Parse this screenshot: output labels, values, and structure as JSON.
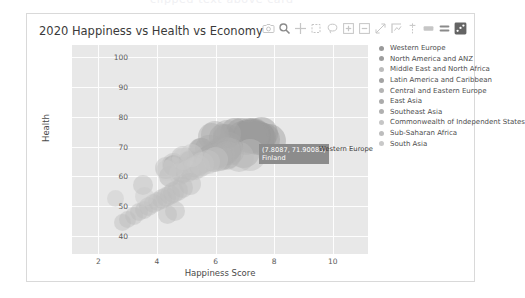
{
  "ghost_text": "clipped text above card",
  "chart_title": "2020 Happiness vs Health vs Economy",
  "modebar": {
    "buttons": [
      {
        "name": "camera-icon",
        "label": "Download plot as a png"
      },
      {
        "name": "zoom-icon",
        "label": "Zoom"
      },
      {
        "name": "pan-icon",
        "label": "Pan"
      },
      {
        "name": "zoom-box-select-icon",
        "label": "Box Select"
      },
      {
        "name": "lasso-select-icon",
        "label": "Lasso Select"
      },
      {
        "name": "zoom-in-icon",
        "label": "Zoom in"
      },
      {
        "name": "zoom-out-icon",
        "label": "Zoom out"
      },
      {
        "name": "autoscale-icon",
        "label": "Autoscale"
      },
      {
        "name": "reset-axes-icon",
        "label": "Reset axes"
      },
      {
        "name": "spike-lines-icon",
        "label": "Toggle Spike Lines"
      },
      {
        "name": "hover-compare-icon",
        "label": "Show closest data on hover"
      },
      {
        "name": "hover-closest-icon",
        "label": "Compare data on hover"
      },
      {
        "name": "plotly-logo-icon",
        "label": "Produced with Plotly"
      }
    ]
  },
  "tooltip": {
    "coords": "(7.8087, 71.90083)",
    "country": "Finland",
    "trace": "Western Europe"
  },
  "legend": {
    "items": [
      {
        "label": "Western Europe",
        "color": "#9a9a9a"
      },
      {
        "label": "North America and ANZ",
        "color": "#9e9e9e"
      },
      {
        "label": "Middle East and North Africa",
        "color": "#bcbcbc"
      },
      {
        "label": "Latin America and Caribbean",
        "color": "#a3a3a3"
      },
      {
        "label": "Central and Eastern Europe",
        "color": "#b4b4b4"
      },
      {
        "label": "East Asia",
        "color": "#ababab"
      },
      {
        "label": "Southeast Asia",
        "color": "#b0b0b0"
      },
      {
        "label": "Commonwealth of Independent States",
        "color": "#c6c6c6"
      },
      {
        "label": "Sub-Saharan Africa",
        "color": "#bdbdbd"
      },
      {
        "label": "South Asia",
        "color": "#c9c9c9"
      }
    ]
  },
  "chart_data": {
    "type": "scatter",
    "title": "2020 Happiness vs Health vs Economy",
    "xlabel": "Happiness Score",
    "ylabel": "Health",
    "xlim": [
      1.1,
      11.2
    ],
    "ylim": [
      34,
      104
    ],
    "xticks": [
      2,
      4,
      6,
      8,
      10
    ],
    "yticks": [
      40,
      50,
      60,
      70,
      80,
      90,
      100
    ],
    "grid": true,
    "legend_position": "right",
    "size_encodes": "Economy (GDP per capita)",
    "marker_opacity": 0.45,
    "series": [
      {
        "name": "Western Europe",
        "color": "#9a9a9a",
        "points": [
          {
            "x": 7.81,
            "y": 71.9,
            "size": 34,
            "label": "Finland"
          },
          {
            "x": 7.65,
            "y": 72.4,
            "size": 33
          },
          {
            "x": 7.56,
            "y": 74.4,
            "size": 33
          },
          {
            "x": 7.5,
            "y": 73.0,
            "size": 32
          },
          {
            "x": 7.45,
            "y": 72.7,
            "size": 34
          },
          {
            "x": 7.35,
            "y": 73.3,
            "size": 31
          },
          {
            "x": 7.3,
            "y": 73.9,
            "size": 32
          },
          {
            "x": 7.23,
            "y": 72.6,
            "size": 31
          },
          {
            "x": 7.16,
            "y": 74.0,
            "size": 33
          },
          {
            "x": 7.09,
            "y": 73.8,
            "size": 30
          },
          {
            "x": 7.03,
            "y": 72.2,
            "size": 30
          },
          {
            "x": 6.91,
            "y": 73.2,
            "size": 31
          },
          {
            "x": 6.86,
            "y": 74.1,
            "size": 32
          },
          {
            "x": 6.66,
            "y": 74.5,
            "size": 30
          },
          {
            "x": 6.4,
            "y": 72.8,
            "size": 28
          },
          {
            "x": 6.22,
            "y": 73.1,
            "size": 27
          },
          {
            "x": 5.52,
            "y": 68.7,
            "size": 25
          }
        ]
      },
      {
        "name": "North America and ANZ",
        "color": "#9e9e9e",
        "points": [
          {
            "x": 7.29,
            "y": 73.9,
            "size": 33
          },
          {
            "x": 7.23,
            "y": 73.6,
            "size": 34
          },
          {
            "x": 7.18,
            "y": 73.3,
            "size": 33
          },
          {
            "x": 6.94,
            "y": 68.3,
            "size": 33
          }
        ]
      },
      {
        "name": "Middle East and North Africa",
        "color": "#bcbcbc",
        "points": [
          {
            "x": 7.16,
            "y": 67.0,
            "size": 32
          },
          {
            "x": 6.79,
            "y": 66.6,
            "size": 30
          },
          {
            "x": 6.38,
            "y": 67.1,
            "size": 29
          },
          {
            "x": 6.13,
            "y": 66.5,
            "size": 27
          },
          {
            "x": 5.85,
            "y": 66.3,
            "size": 27
          },
          {
            "x": 5.52,
            "y": 67.4,
            "size": 26
          },
          {
            "x": 5.36,
            "y": 64.6,
            "size": 25
          },
          {
            "x": 5.12,
            "y": 64.8,
            "size": 24
          },
          {
            "x": 4.88,
            "y": 66.1,
            "size": 24
          },
          {
            "x": 4.55,
            "y": 64.1,
            "size": 23
          },
          {
            "x": 4.32,
            "y": 62.7,
            "size": 22
          },
          {
            "x": 3.53,
            "y": 57.0,
            "size": 20
          }
        ]
      },
      {
        "name": "Latin America and Caribbean",
        "color": "#a3a3a3",
        "points": [
          {
            "x": 6.47,
            "y": 70.1,
            "size": 28
          },
          {
            "x": 6.4,
            "y": 69.4,
            "size": 27
          },
          {
            "x": 6.33,
            "y": 68.2,
            "size": 27
          },
          {
            "x": 6.3,
            "y": 69.9,
            "size": 26
          },
          {
            "x": 6.23,
            "y": 67.9,
            "size": 26
          },
          {
            "x": 6.16,
            "y": 68.8,
            "size": 26
          },
          {
            "x": 6.13,
            "y": 67.5,
            "size": 25
          },
          {
            "x": 5.95,
            "y": 67.8,
            "size": 25
          },
          {
            "x": 5.86,
            "y": 66.9,
            "size": 25
          },
          {
            "x": 5.77,
            "y": 66.4,
            "size": 24
          },
          {
            "x": 5.69,
            "y": 65.7,
            "size": 24
          },
          {
            "x": 5.53,
            "y": 65.1,
            "size": 23
          },
          {
            "x": 5.12,
            "y": 64.9,
            "size": 22
          },
          {
            "x": 4.57,
            "y": 63.5,
            "size": 21
          }
        ]
      },
      {
        "name": "Central and Eastern Europe",
        "color": "#b4b4b4",
        "points": [
          {
            "x": 6.52,
            "y": 68.2,
            "size": 27
          },
          {
            "x": 6.4,
            "y": 68.9,
            "size": 26
          },
          {
            "x": 6.22,
            "y": 67.6,
            "size": 26
          },
          {
            "x": 6.12,
            "y": 67.1,
            "size": 25
          },
          {
            "x": 6.0,
            "y": 66.7,
            "size": 25
          },
          {
            "x": 5.88,
            "y": 66.2,
            "size": 25
          },
          {
            "x": 5.77,
            "y": 65.9,
            "size": 24
          },
          {
            "x": 5.66,
            "y": 65.4,
            "size": 24
          },
          {
            "x": 5.55,
            "y": 64.9,
            "size": 23
          },
          {
            "x": 5.4,
            "y": 64.3,
            "size": 23
          },
          {
            "x": 5.22,
            "y": 63.6,
            "size": 22
          },
          {
            "x": 4.91,
            "y": 62.9,
            "size": 22
          }
        ]
      },
      {
        "name": "East Asia",
        "color": "#ababab",
        "points": [
          {
            "x": 6.38,
            "y": 74.1,
            "size": 28
          },
          {
            "x": 5.97,
            "y": 73.9,
            "size": 28
          },
          {
            "x": 5.87,
            "y": 73.3,
            "size": 27
          },
          {
            "x": 5.77,
            "y": 69.3,
            "size": 28
          },
          {
            "x": 5.47,
            "y": 68.7,
            "size": 25
          }
        ]
      },
      {
        "name": "Southeast Asia",
        "color": "#b0b0b0",
        "points": [
          {
            "x": 6.38,
            "y": 67.0,
            "size": 28
          },
          {
            "x": 6.16,
            "y": 66.3,
            "size": 26
          },
          {
            "x": 5.92,
            "y": 65.5,
            "size": 25
          },
          {
            "x": 5.38,
            "y": 63.9,
            "size": 24
          },
          {
            "x": 5.13,
            "y": 62.8,
            "size": 23
          },
          {
            "x": 4.85,
            "y": 61.4,
            "size": 22
          },
          {
            "x": 4.43,
            "y": 59.9,
            "size": 21
          }
        ]
      },
      {
        "name": "Commonwealth of Independent States",
        "color": "#c6c6c6",
        "points": [
          {
            "x": 6.01,
            "y": 65.6,
            "size": 25
          },
          {
            "x": 5.73,
            "y": 64.7,
            "size": 24
          },
          {
            "x": 5.55,
            "y": 64.0,
            "size": 24
          },
          {
            "x": 5.43,
            "y": 63.4,
            "size": 23
          },
          {
            "x": 5.28,
            "y": 62.7,
            "size": 23
          },
          {
            "x": 5.05,
            "y": 61.8,
            "size": 22
          },
          {
            "x": 4.78,
            "y": 60.9,
            "size": 22
          }
        ]
      },
      {
        "name": "Sub-Saharan Africa",
        "color": "#bdbdbd",
        "points": [
          {
            "x": 5.12,
            "y": 57.5,
            "size": 22
          },
          {
            "x": 4.88,
            "y": 56.2,
            "size": 21
          },
          {
            "x": 4.71,
            "y": 55.4,
            "size": 21
          },
          {
            "x": 4.56,
            "y": 54.6,
            "size": 21
          },
          {
            "x": 4.44,
            "y": 53.9,
            "size": 20
          },
          {
            "x": 4.31,
            "y": 53.1,
            "size": 20
          },
          {
            "x": 4.18,
            "y": 52.4,
            "size": 20
          },
          {
            "x": 4.03,
            "y": 51.6,
            "size": 19
          },
          {
            "x": 3.88,
            "y": 50.8,
            "size": 19
          },
          {
            "x": 3.72,
            "y": 49.9,
            "size": 19
          },
          {
            "x": 3.55,
            "y": 48.9,
            "size": 18
          },
          {
            "x": 3.38,
            "y": 47.9,
            "size": 18
          },
          {
            "x": 3.2,
            "y": 46.8,
            "size": 18
          },
          {
            "x": 2.98,
            "y": 45.5,
            "size": 17
          },
          {
            "x": 2.81,
            "y": 44.4,
            "size": 17
          },
          {
            "x": 4.6,
            "y": 48.5,
            "size": 20
          },
          {
            "x": 4.35,
            "y": 47.2,
            "size": 19
          }
        ]
      },
      {
        "name": "South Asia",
        "color": "#c9c9c9",
        "points": [
          {
            "x": 5.19,
            "y": 67.0,
            "size": 23
          },
          {
            "x": 4.88,
            "y": 65.7,
            "size": 22
          },
          {
            "x": 4.55,
            "y": 63.1,
            "size": 21
          },
          {
            "x": 4.32,
            "y": 62.0,
            "size": 21
          },
          {
            "x": 3.57,
            "y": 53.2,
            "size": 19
          },
          {
            "x": 2.57,
            "y": 52.5,
            "size": 17
          }
        ]
      }
    ]
  }
}
